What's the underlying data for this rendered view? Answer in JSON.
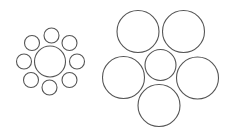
{
  "figure": {
    "name": "Ebbinghaus illusion",
    "stroke_color": "#555555",
    "background": "#ffffff"
  },
  "groups": [
    {
      "id": "left-small-surround",
      "center": {
        "cx": 50,
        "cy": 61.5,
        "r": 15.5
      },
      "satellites": [
        {
          "cx": 51.5,
          "cy": 35.5,
          "r": 7.5
        },
        {
          "cx": 69.5,
          "cy": 43,
          "r": 7.5
        },
        {
          "cx": 77,
          "cy": 61.5,
          "r": 7.5
        },
        {
          "cx": 69.5,
          "cy": 80,
          "r": 7.5
        },
        {
          "cx": 49.5,
          "cy": 87.5,
          "r": 7.5
        },
        {
          "cx": 31,
          "cy": 80,
          "r": 7.5
        },
        {
          "cx": 24,
          "cy": 61.5,
          "r": 7.5
        },
        {
          "cx": 32,
          "cy": 43,
          "r": 7.5
        }
      ]
    },
    {
      "id": "right-large-surround",
      "center": {
        "cx": 160.5,
        "cy": 65,
        "r": 15.5
      },
      "satellites": [
        {
          "cx": 138,
          "cy": 31.5,
          "r": 21
        },
        {
          "cx": 183.5,
          "cy": 31.5,
          "r": 21
        },
        {
          "cx": 197.5,
          "cy": 78,
          "r": 21
        },
        {
          "cx": 159,
          "cy": 105.5,
          "r": 21
        },
        {
          "cx": 123.5,
          "cy": 77.5,
          "r": 21
        }
      ]
    }
  ]
}
